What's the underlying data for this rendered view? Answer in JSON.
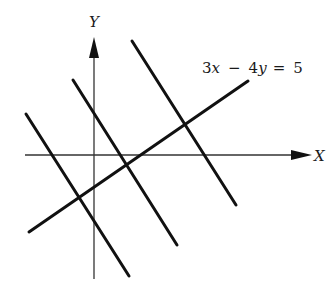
{
  "diagram": {
    "type": "coordinate-plane",
    "axes": {
      "x_label": "X",
      "y_label": "Y",
      "origin_px": [
        94,
        155
      ]
    },
    "labeled_line": {
      "equation": "3x − 4y = 5",
      "parts": {
        "c1": "3",
        "v1": "x",
        "op": "−",
        "c2": "4",
        "v2": "y",
        "eq": "=",
        "rhs": "5"
      }
    },
    "lines": [
      {
        "name": "line-3x-4y-5",
        "from": [
          29,
          232
        ],
        "to": [
          248,
          81
        ]
      },
      {
        "name": "perpendicular-line-1",
        "from": [
          26,
          114
        ],
        "to": [
          129,
          276
        ]
      },
      {
        "name": "perpendicular-line-2",
        "from": [
          73,
          80
        ],
        "to": [
          177,
          245
        ]
      },
      {
        "name": "perpendicular-line-3",
        "from": [
          132,
          41
        ],
        "to": [
          236,
          205
        ]
      }
    ],
    "colors": {
      "ink": "#111111",
      "axis": "#333333",
      "background": "#ffffff"
    }
  }
}
